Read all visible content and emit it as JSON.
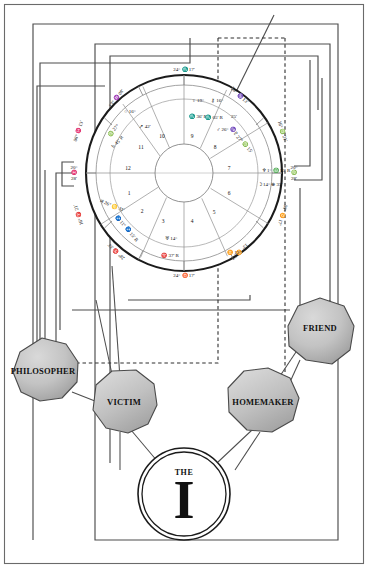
{
  "diagram": {
    "type": "astrology-wheel-with-persona-nodes"
  },
  "ego": {
    "the_label": "THE",
    "letter": "I"
  },
  "personas": [
    {
      "id": "philosopher",
      "label": "PHILOSOPHER",
      "x": 43,
      "y": 371,
      "font_size": 8.5
    },
    {
      "id": "victim",
      "label": "VICTIM",
      "x": 119,
      "y": 404,
      "font_size": 8.5
    },
    {
      "id": "homemaker",
      "label": "HOMEMAKER",
      "x": 264,
      "y": 404,
      "font_size": 8.5
    },
    {
      "id": "friend",
      "label": "FRIEND",
      "x": 317,
      "y": 328,
      "font_size": 8.5
    }
  ],
  "wheel": {
    "center_x": 184,
    "center_y": 173,
    "outer_radius": 98,
    "zodiac_inner_radius": 88,
    "house_ring_radius": 74,
    "inner_radius": 29,
    "angles": [
      {
        "name": "midheaven",
        "text_lines": [
          "24° ♏ 17'"
        ],
        "x": 184,
        "y": 70,
        "rot": 0
      },
      {
        "name": "ascendant",
        "text_lines": [
          "20°",
          "♓",
          "28'"
        ],
        "x": 74,
        "y": 173,
        "rot": 0
      },
      {
        "name": "descendant",
        "text_lines": [
          "20°",
          "♍",
          "28'"
        ],
        "x": 294,
        "y": 173,
        "rot": 0
      },
      {
        "name": "imum-coeli",
        "text_lines": [
          "24° ♉ 17'"
        ],
        "x": 184,
        "y": 276,
        "rot": 0
      }
    ],
    "cusps": [
      {
        "label": "13° ♒ 08'",
        "x": 116,
        "y": 98,
        "rot": -52
      },
      {
        "label": "28° ♑ 13'",
        "x": 240,
        "y": 95,
        "rot": 44
      },
      {
        "label": "16° ♍ 21'",
        "x": 283,
        "y": 131,
        "rot": 72
      },
      {
        "label": "08° ♊ 17'",
        "x": 283,
        "y": 215,
        "rot": 108
      },
      {
        "label": "13° ♊ 08'",
        "x": 240,
        "y": 252,
        "rot": 136
      },
      {
        "label": "28° ♈ 33'",
        "x": 116,
        "y": 252,
        "rot": -136
      },
      {
        "label": "16° ♈ 21'",
        "x": 78,
        "y": 215,
        "rot": -108
      },
      {
        "label": "08° ♓ 13'",
        "x": 78,
        "y": 131,
        "rot": -72
      }
    ],
    "house_numbers": [
      {
        "n": "10",
        "x": 162,
        "y": 136
      },
      {
        "n": "11",
        "x": 141,
        "y": 147
      },
      {
        "n": "12",
        "x": 128,
        "y": 168
      },
      {
        "n": "1",
        "x": 129,
        "y": 193
      },
      {
        "n": "2",
        "x": 142,
        "y": 211
      },
      {
        "n": "3",
        "x": 163,
        "y": 221
      },
      {
        "n": "4",
        "x": 192,
        "y": 221
      },
      {
        "n": "5",
        "x": 214,
        "y": 212
      },
      {
        "n": "6",
        "x": 229,
        "y": 193
      },
      {
        "n": "7",
        "x": 229,
        "y": 168
      },
      {
        "n": "8",
        "x": 215,
        "y": 147
      },
      {
        "n": "9",
        "x": 192,
        "y": 136
      }
    ],
    "planets": [
      {
        "glyph": "○",
        "text": "16°",
        "x": 130,
        "y": 111,
        "rot": 0
      },
      {
        "glyph": "↗",
        "text": "42'",
        "x": 145,
        "y": 126,
        "rot": 0
      },
      {
        "glyph": "♍",
        "text": "27°",
        "x": 113,
        "y": 130,
        "rot": -48
      },
      {
        "glyph": "♄",
        "text": "45'  R",
        "x": 117,
        "y": 142,
        "rot": -48
      },
      {
        "glyph": "♀",
        "text": "19°",
        "x": 198,
        "y": 100,
        "rot": 0
      },
      {
        "glyph": "♏",
        "text": "36'  R",
        "x": 198,
        "y": 116,
        "rot": 0
      },
      {
        "glyph": "⚷",
        "text": "16°",
        "x": 217,
        "y": 100,
        "rot": 0
      },
      {
        "glyph": "♏",
        "text": "05'  R",
        "x": 214,
        "y": 117,
        "rot": 0
      },
      {
        "glyph": "",
        "text": "25'",
        "x": 234,
        "y": 116,
        "rot": 0
      },
      {
        "glyph": "♂",
        "text": "26° ♑",
        "x": 226,
        "y": 129,
        "rot": 0
      },
      {
        "glyph": "♇",
        "text": "27° ♍ 15'",
        "x": 243,
        "y": 142,
        "rot": 48
      },
      {
        "glyph": "♆",
        "text": "1° ♎ 13'  R",
        "x": 276,
        "y": 170,
        "rot": 0
      },
      {
        "glyph": "☽",
        "text": "14° ⊕ 35'",
        "x": 270,
        "y": 184,
        "rot": 0
      },
      {
        "glyph": "♃",
        "text": "26° ♋ 31'",
        "x": 112,
        "y": 205,
        "rot": 22
      },
      {
        "glyph": "♐",
        "text": "11° ♐ 15'  R",
        "x": 127,
        "y": 228,
        "rot": 50
      },
      {
        "glyph": "♅",
        "text": "14°",
        "x": 171,
        "y": 238,
        "rot": 0
      },
      {
        "glyph": "♈",
        "text": "37'  R",
        "x": 170,
        "y": 255,
        "rot": 0
      },
      {
        "glyph": "♊",
        "text": "13°",
        "x": 234,
        "y": 252,
        "rot": 0
      }
    ]
  },
  "frames": {
    "note": "nested rectangular routing lines connecting wheel to persona nodes"
  }
}
